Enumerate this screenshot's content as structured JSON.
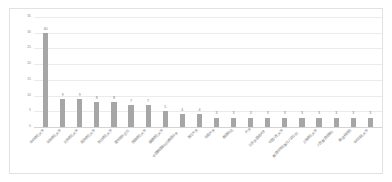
{
  "chart_data": {
    "type": "bar",
    "title": "",
    "xlabel": "",
    "ylabel": "",
    "ylim": [
      0,
      35
    ],
    "grid": true,
    "legend": "none",
    "bar_color": "#a6a6a6",
    "yticks": [
      "0",
      "5",
      "10",
      "15",
      "20",
      "25",
      "30",
      "35"
    ],
    "categories": [
      "华中师范大学",
      "华东师范大学",
      "北京师范大学",
      "南京师范大学",
      "东北师范大学",
      "图书馆杂志社",
      "西南师范大学",
      "福建师范大学",
      "中国教育报刊社教育科学",
      "浙江大学",
      "华南大学",
      "教育研究",
      "大学",
      "北京外国语大学",
      "中国人民大学",
      "教育科学出版社人文社科",
      "上海师范大学",
      "人民教育出版社",
      "教育研究院",
      "华中科技大学"
    ],
    "values": [
      30,
      9,
      9,
      8,
      8,
      7,
      7,
      5,
      4,
      4,
      3,
      3,
      3,
      3,
      3,
      3,
      3,
      3,
      3,
      3
    ]
  }
}
